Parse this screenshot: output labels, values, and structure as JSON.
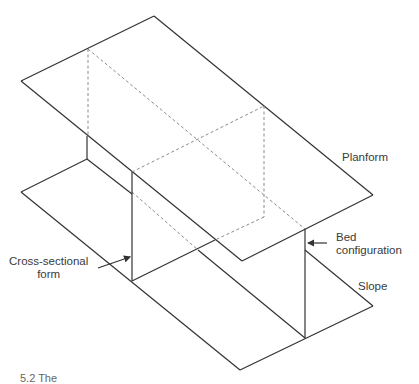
{
  "diagram": {
    "labels": {
      "planform": "Planform",
      "bed_configuration_line1": "Bed",
      "bed_configuration_line2": "configuration",
      "cross_section_line1": "Cross-sectional",
      "cross_section_line2": "form",
      "slope": "Slope"
    },
    "caption_partial": "5.2 The",
    "colors": {
      "line": "#333333",
      "dashed": "#8a8a8a",
      "text": "#3a3a3a",
      "background": "#ffffff"
    }
  }
}
